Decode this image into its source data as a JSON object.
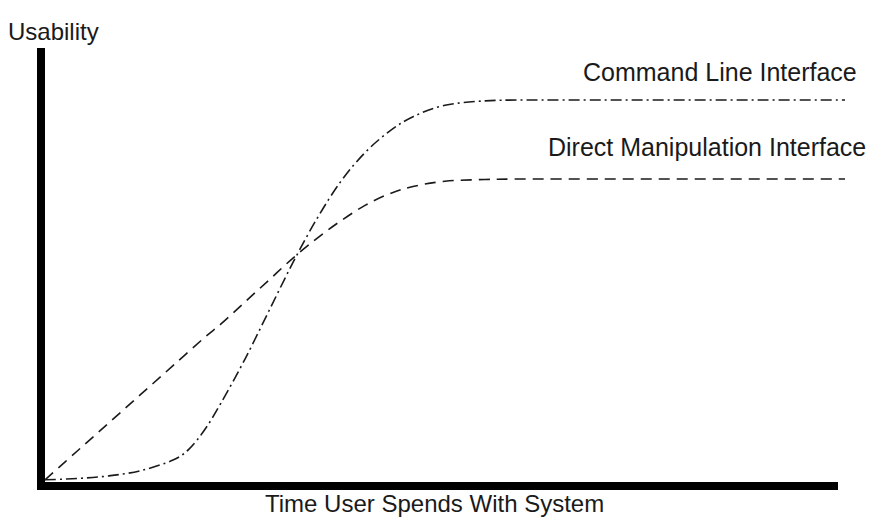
{
  "figure": {
    "background_color": "#ffffff",
    "ink_color": "#1a1a1a",
    "axis_color": "#000000"
  },
  "axes": {
    "y_title": "Usability",
    "x_title": "Time User Spends With System"
  },
  "series_labels": {
    "cli": "Command Line Interface",
    "dmi": "Direct Manipulation Interface"
  },
  "chart_data": {
    "type": "line",
    "title": "",
    "subtitle": "",
    "xlabel": "Time User Spends With System",
    "ylabel": "Usability",
    "xlim": [
      0,
      100
    ],
    "ylim": [
      0,
      100
    ],
    "grid": false,
    "axis_ticks": false,
    "tick_labels": [],
    "legend_position": "inline-right-of-curves",
    "annotations": [
      {
        "text": "Command Line Interface",
        "x": 68,
        "y": 96,
        "describes": "cli"
      },
      {
        "text": "Direct Manipulation Interface",
        "x": 64,
        "y": 78,
        "describes": "dmi"
      }
    ],
    "crossover_point": {
      "x": 22,
      "y": 36
    },
    "series": [
      {
        "name": "Command Line Interface",
        "line_style": "dash-dot",
        "dasharray": "11,4,2,4",
        "line_width": 1.6,
        "color": "#1a1a1a",
        "plateau_value": 87,
        "x": [
          0,
          4,
          8,
          12,
          16,
          18,
          20,
          22,
          25,
          28,
          31,
          34,
          37,
          40,
          43,
          46,
          50,
          55,
          60,
          70,
          80,
          90,
          100
        ],
        "y": [
          0.5,
          0.8,
          1.4,
          2.6,
          5.0,
          7.5,
          12.0,
          18.0,
          28.0,
          39.0,
          50.0,
          60.0,
          68.5,
          75.0,
          79.8,
          83.2,
          85.8,
          86.8,
          87.0,
          87.0,
          87.0,
          87.0,
          87.0
        ]
      },
      {
        "name": "Direct Manipulation Interface",
        "line_style": "dashed",
        "dasharray": "11,7",
        "line_width": 1.6,
        "color": "#1a1a1a",
        "plateau_value": 69,
        "x": [
          0,
          4,
          8,
          12,
          16,
          20,
          22,
          25,
          28,
          31,
          34,
          37,
          40,
          43,
          46,
          50,
          55,
          60,
          70,
          80,
          90,
          100
        ],
        "y": [
          0.5,
          7.0,
          13.5,
          20.0,
          26.5,
          33.0,
          36.0,
          41.0,
          46.0,
          51.0,
          55.5,
          59.5,
          63.0,
          65.6,
          67.3,
          68.5,
          68.9,
          69.0,
          69.0,
          69.0,
          69.0,
          69.0
        ]
      }
    ]
  },
  "geometry": {
    "origin_px": {
      "x": 45,
      "y": 482
    },
    "x_axis_end_px": 838,
    "y_axis_top_px": 48,
    "axis_thickness_px": 8
  }
}
